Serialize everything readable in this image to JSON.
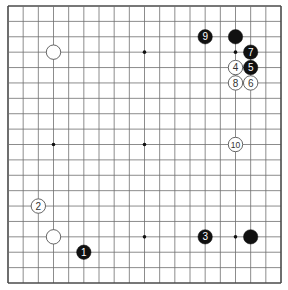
{
  "board": {
    "size": 19,
    "origin": {
      "x": 8,
      "y": 6
    },
    "end": {
      "x": 281,
      "y": 283
    },
    "line_color": "#6e6e6e",
    "border_color": "#4a4a4a",
    "hoshi": [
      [
        3,
        3
      ],
      [
        9,
        3
      ],
      [
        15,
        3
      ],
      [
        3,
        9
      ],
      [
        9,
        9
      ],
      [
        15,
        9
      ],
      [
        3,
        15
      ],
      [
        9,
        15
      ],
      [
        15,
        15
      ]
    ]
  },
  "stones": [
    {
      "color": "white",
      "col": 3,
      "row": 3,
      "label": ""
    },
    {
      "color": "black",
      "col": 15,
      "row": 2,
      "label": ""
    },
    {
      "color": "black",
      "col": 13,
      "row": 2,
      "label": "9"
    },
    {
      "color": "black",
      "col": 16,
      "row": 3,
      "label": "7"
    },
    {
      "color": "white",
      "col": 15,
      "row": 4,
      "label": "4"
    },
    {
      "color": "black",
      "col": 16,
      "row": 4,
      "label": "5"
    },
    {
      "color": "white",
      "col": 15,
      "row": 5,
      "label": "8"
    },
    {
      "color": "white",
      "col": 16,
      "row": 5,
      "label": "6"
    },
    {
      "color": "white",
      "col": 15,
      "row": 9,
      "label": "10"
    },
    {
      "color": "white",
      "col": 2,
      "row": 13,
      "label": "2"
    },
    {
      "color": "white",
      "col": 3,
      "row": 15,
      "label": ""
    },
    {
      "color": "black",
      "col": 5,
      "row": 16,
      "label": "1"
    },
    {
      "color": "black",
      "col": 13,
      "row": 15,
      "label": "3"
    },
    {
      "color": "black",
      "col": 16,
      "row": 15,
      "label": ""
    }
  ],
  "colors": {
    "black_stone": "#111111",
    "white_stone": "#ffffff",
    "white_stone_stroke": "#555555",
    "black_label": "#ffffff",
    "white_label": "#333333"
  }
}
